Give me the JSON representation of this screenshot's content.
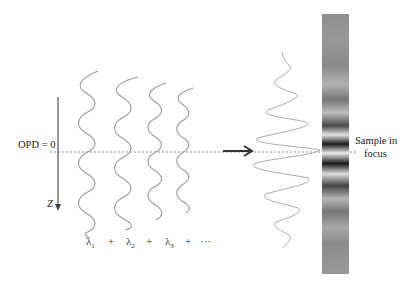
{
  "figure": {
    "labels": {
      "opd": "OPD = 0",
      "z_axis": "Z",
      "sample_line1": "Sample in",
      "sample_line2": "focus"
    },
    "wavelength_sum": {
      "terms": [
        {
          "symbol": "λ",
          "sub": "1"
        },
        {
          "symbol": "λ",
          "sub": "2"
        },
        {
          "symbol": "λ",
          "sub": "3"
        }
      ],
      "plus": "+",
      "ellipsis": "···"
    },
    "colors": {
      "wave": "#9a9a9a",
      "axis": "#555555",
      "arrow": "#333333",
      "dotted_line": "#777777",
      "bar_dark": "#1a1a1a",
      "bar_light": "#dcdcdc",
      "bar_mid": "#8c8c8c"
    },
    "components": [
      "z-axis-arrow",
      "individual-wavelength-waves",
      "opd-zero-reference-line",
      "summation-arrow",
      "interference-envelope-signal",
      "fringe-intensity-bar"
    ]
  }
}
